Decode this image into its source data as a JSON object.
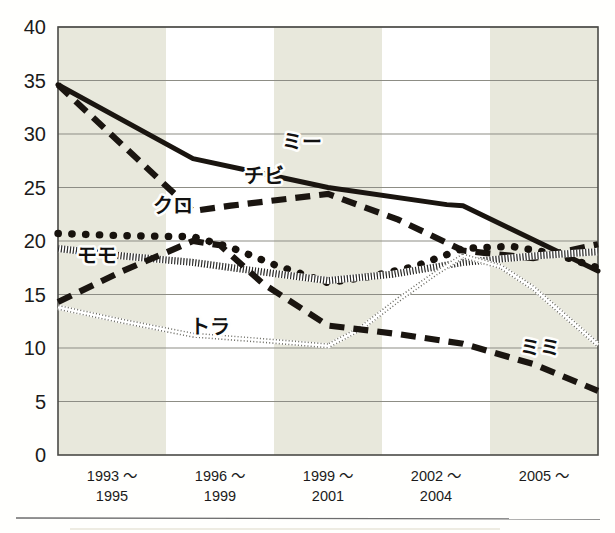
{
  "chart_data": {
    "type": "line",
    "title": "",
    "subtitle": "",
    "xlabel": "",
    "ylabel": "",
    "ylim": [
      0,
      40
    ],
    "yticks": [
      0,
      5,
      10,
      15,
      20,
      25,
      30,
      35,
      40
    ],
    "grid": true,
    "legend_position": "inline-labels",
    "categories": [
      "1993 〜\n1995",
      "1996 〜\n1999",
      "1999 〜\n2001",
      "2002 〜\n2004",
      "2005 〜"
    ],
    "category_lines": [
      [
        "1993 〜",
        "1995"
      ],
      [
        "1996 〜",
        "1999"
      ],
      [
        "1999 〜",
        "2001"
      ],
      [
        "2002 〜",
        "2004"
      ],
      [
        "2005 〜",
        ""
      ]
    ],
    "band_shading": [
      "shaded",
      "white",
      "shaded",
      "white",
      "shaded"
    ],
    "series": [
      {
        "name": "ミー",
        "style": "solid-thick",
        "color": "#1a1510",
        "label_x_frac": 0.415,
        "label_y_value": 28.6,
        "values": [
          34.6,
          27.7,
          25.0,
          23.3,
          17.2
        ],
        "dense_x": [
          0.0,
          0.25,
          0.5,
          0.72,
          0.75,
          1.0
        ],
        "dense_y": [
          34.6,
          27.7,
          25.0,
          23.4,
          23.3,
          17.2
        ]
      },
      {
        "name": "チビ",
        "style": "dashed-thick",
        "color": "#1a1510",
        "label_x_frac": 0.345,
        "label_y_value": 25.4,
        "values": [
          34.6,
          22.8,
          24.4,
          19.1,
          19.7
        ],
        "dense_x": [
          0.0,
          0.25,
          0.32,
          0.5,
          0.63,
          0.75,
          0.88,
          1.0
        ],
        "dense_y": [
          34.6,
          22.8,
          23.3,
          24.4,
          22.0,
          19.1,
          18.4,
          19.7
        ]
      },
      {
        "name": "クロ",
        "style": "dotted-round",
        "color": "#17120d",
        "label_x_frac": 0.175,
        "label_y_value": 22.6,
        "values": [
          20.7,
          20.4,
          16.1,
          19.3,
          17.5
        ],
        "dense_x": [
          0.0,
          0.12,
          0.25,
          0.32,
          0.4,
          0.5,
          0.58,
          0.66,
          0.75,
          0.84,
          0.92,
          1.0
        ],
        "dense_y": [
          20.7,
          20.5,
          20.4,
          19.4,
          17.8,
          16.1,
          16.7,
          17.6,
          19.3,
          19.5,
          18.8,
          17.5
        ]
      },
      {
        "name": "モモ",
        "style": "hatched-band",
        "color": "#2a2a28",
        "label_x_frac": 0.035,
        "label_y_value": 17.9,
        "values": [
          19.3,
          18.0,
          16.3,
          18.0,
          19.0
        ],
        "dense_x": [
          0.0,
          0.12,
          0.25,
          0.38,
          0.5,
          0.62,
          0.75,
          0.88,
          1.0
        ],
        "dense_y": [
          19.3,
          18.6,
          18.0,
          17.1,
          16.3,
          16.9,
          18.0,
          18.6,
          19.0
        ]
      },
      {
        "name": "トラ",
        "style": "chain-thin",
        "color": "#6b6b63",
        "label_x_frac": 0.245,
        "label_y_value": 11.3,
        "values": [
          13.8,
          11.2,
          10.2,
          18.6,
          10.3
        ],
        "dense_x": [
          0.0,
          0.12,
          0.25,
          0.38,
          0.5,
          0.56,
          0.63,
          0.7,
          0.75,
          0.82,
          0.88,
          1.0
        ],
        "dense_y": [
          13.8,
          12.5,
          11.2,
          10.7,
          10.2,
          11.8,
          14.5,
          17.0,
          18.6,
          17.6,
          15.6,
          10.3
        ]
      },
      {
        "name": "ミミ",
        "style": "dashed-thick",
        "color": "#1a1510",
        "label_x_frac": 0.855,
        "label_y_value": 9.3,
        "values": [
          14.3,
          20.0,
          12.1,
          10.4,
          6.0
        ],
        "dense_x": [
          0.0,
          0.12,
          0.25,
          0.3,
          0.38,
          0.5,
          0.63,
          0.75,
          0.88,
          1.0
        ],
        "dense_y": [
          14.3,
          17.2,
          20.0,
          19.6,
          16.0,
          12.1,
          11.3,
          10.4,
          8.5,
          6.0
        ]
      }
    ]
  },
  "axis": {
    "y_tick_labels": [
      "40",
      "35",
      "30",
      "25",
      "20",
      "15",
      "10",
      "5",
      "0"
    ],
    "x_tick_labels_top": [
      "1993 〜",
      "1996 〜",
      "1999 〜",
      "2002 〜",
      "2005 〜"
    ],
    "x_tick_labels_bottom": [
      "1995",
      "1999",
      "2001",
      "2004",
      ""
    ]
  },
  "colors": {
    "band_shaded": "#e8e8dc",
    "band_white": "#ffffff",
    "gridline": "#8d8d85",
    "axis_line": "#4a4a46",
    "page_background": "#fffffd",
    "ink": "#1a1510"
  }
}
